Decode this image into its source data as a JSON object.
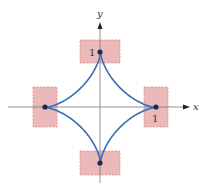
{
  "diagram": {
    "type": "astroid",
    "axes": {
      "x_label": "x",
      "y_label": "y"
    },
    "tick_labels": {
      "y_one": "1",
      "x_one": "1"
    },
    "cusps": [
      {
        "name": "top",
        "x": 0,
        "y": 1
      },
      {
        "name": "right",
        "x": 1,
        "y": 0
      },
      {
        "name": "bottom",
        "x": 0,
        "y": -1
      },
      {
        "name": "left",
        "x": -1,
        "y": 0
      }
    ],
    "colors": {
      "curve": "#3a6db5",
      "cusp_dot": "#1a2a5a",
      "box_fill": "#ebb9b9",
      "box_border": "#d98a8a",
      "axis": "#777777"
    }
  }
}
